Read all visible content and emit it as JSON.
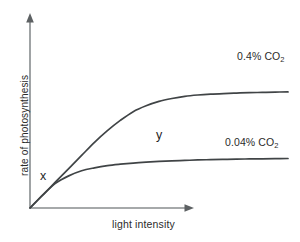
{
  "figure": {
    "background_color": "#ffffff",
    "axis_color": "#888c8e",
    "curve_color": "#404446",
    "text_color": "#2b2b2b"
  },
  "axes": {
    "y_label": "rate of photosynthesis",
    "x_label": "light intensity",
    "y_arrow": "up-arrow-icon",
    "x_arrow": "right-arrow-icon"
  },
  "annotations": {
    "marker_x": "x",
    "marker_y": "y"
  },
  "series_labels": {
    "high": {
      "value": "0.4%",
      "gas": "CO",
      "sub": "2"
    },
    "low": {
      "value": "0.04%",
      "gas": "CO",
      "sub": "2"
    }
  },
  "chart_data": {
    "type": "line",
    "title": "",
    "xlabel": "light intensity",
    "ylabel": "rate of photosynthesis",
    "xlim": [
      0,
      100
    ],
    "ylim": [
      0,
      100
    ],
    "grid": false,
    "axis_ticks": false,
    "legend": "inline-right-end-of-curve",
    "annotations": [
      {
        "text": "x",
        "x": 9,
        "y": 22,
        "note": "light-limited region on initial shared slope"
      },
      {
        "text": "y",
        "x": 57,
        "y": 48,
        "note": "plateau of the 0.04% CO2 curve"
      }
    ],
    "series": [
      {
        "name": "0.4% CO2",
        "label": "0.4% CO₂",
        "color": "#404446",
        "x": [
          0,
          5,
          10,
          15,
          20,
          25,
          30,
          35,
          40,
          45,
          50,
          55,
          60,
          65,
          70,
          75,
          80,
          85,
          90,
          95,
          100
        ],
        "y": [
          0,
          9,
          18,
          27,
          36,
          45,
          53,
          60,
          66,
          70,
          73,
          75,
          76.5,
          77.4,
          78,
          78.4,
          78.7,
          79,
          79.2,
          79.4,
          79.5
        ],
        "plateau_value": 79.5
      },
      {
        "name": "0.04% CO2",
        "label": "0.04% CO₂",
        "color": "#404446",
        "x": [
          0,
          5,
          10,
          15,
          20,
          25,
          30,
          35,
          40,
          45,
          50,
          55,
          60,
          65,
          70,
          75,
          80,
          85,
          90,
          95,
          100
        ],
        "y": [
          0,
          9,
          17,
          22,
          25.5,
          27.5,
          29,
          30,
          30.8,
          31.4,
          31.9,
          32.3,
          32.6,
          32.9,
          33.1,
          33.3,
          33.5,
          33.6,
          33.7,
          33.8,
          33.9
        ],
        "plateau_value": 33.9
      }
    ]
  }
}
